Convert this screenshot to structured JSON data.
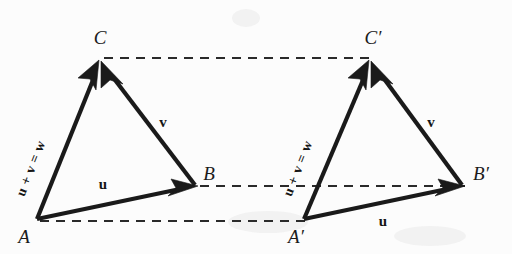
{
  "figure": {
    "background_color": "#fcfcfc",
    "ink_color": "#1a1a1a",
    "triangles": [
      {
        "id": "left",
        "vertices": {
          "A": {
            "label": "A",
            "x": 36,
            "y": 220
          },
          "B": {
            "label": "B",
            "x": 196,
            "y": 186
          },
          "C": {
            "label": "C",
            "x": 100,
            "y": 60
          }
        },
        "vectors": [
          {
            "name": "u",
            "label": "u",
            "from": "A",
            "to": "B",
            "label_x": 103,
            "label_y": 185
          },
          {
            "name": "v",
            "label": "v",
            "from": "B",
            "to": "C",
            "label_x": 160,
            "label_y": 122
          },
          {
            "name": "w",
            "label": "u + v = w",
            "from": "A",
            "to": "C",
            "label_x": 40,
            "label_y": 160,
            "rotation": -52.7
          }
        ]
      },
      {
        "id": "right",
        "vertices": {
          "A": {
            "label": "A′",
            "x": 303,
            "y": 220
          },
          "B": {
            "label": "B′",
            "x": 463,
            "y": 186
          },
          "C": {
            "label": "C′",
            "x": 370,
            "y": 60
          }
        },
        "vectors": [
          {
            "name": "u",
            "label": "u",
            "from": "A",
            "to": "B",
            "label_x": 381,
            "label_y": 222
          },
          {
            "name": "v",
            "label": "v",
            "from": "B",
            "to": "C",
            "label_x": 428,
            "label_y": 122
          },
          {
            "name": "w",
            "label": "u + v = w",
            "from": "A",
            "to": "C",
            "label_x": 308,
            "label_y": 160,
            "rotation": -52.7
          }
        ]
      }
    ],
    "dashed_connectors": [
      {
        "name": "C-to-C-prime",
        "from_x": 104,
        "from_y": 58,
        "to_x": 370,
        "to_y": 58
      },
      {
        "name": "B-to-B-prime",
        "from_x": 200,
        "from_y": 186,
        "to_x": 463,
        "to_y": 186
      },
      {
        "name": "A-to-A-prime",
        "from_x": 40,
        "from_y": 221,
        "to_x": 305,
        "to_y": 221
      }
    ],
    "labels": {
      "vertex_A": "A",
      "vertex_B": "B",
      "vertex_C": "C",
      "vertex_A_prime": "A′",
      "vertex_B_prime": "B′",
      "vertex_C_prime": "C′",
      "vector_u": "u",
      "vector_v": "v",
      "sum_expression": "u + v = w"
    }
  }
}
